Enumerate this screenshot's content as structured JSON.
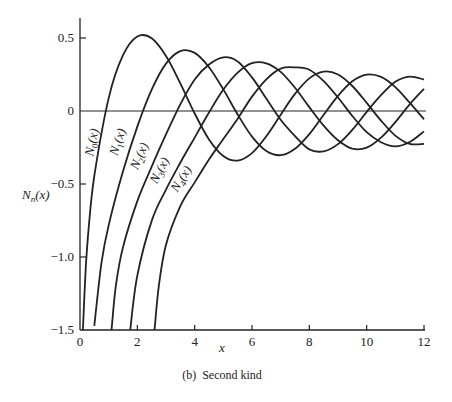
{
  "chart_data": {
    "type": "line",
    "title": "",
    "caption": "(b)  Second kind",
    "xlabel": "x",
    "ylabel": "N_n(x)",
    "xlim": [
      0,
      12
    ],
    "ylim": [
      -1.5,
      0.6
    ],
    "xticks": [
      0,
      2,
      4,
      6,
      8,
      10,
      12
    ],
    "xtick_labels": [
      "0",
      "2",
      "4",
      "6",
      "8",
      "10",
      "12"
    ],
    "yticks": [
      0.5,
      0,
      -0.5,
      -1.0,
      -1.5
    ],
    "ytick_labels": [
      "0.5",
      "0",
      "−0.5",
      "−1.0",
      "−1.5"
    ],
    "grid": false,
    "legend": "inline curve labels",
    "zero_line": true,
    "line_color": "#222222",
    "series": [
      {
        "name": "N0(x)",
        "label_main": "N",
        "label_sub": "0",
        "label_tail": "(x)",
        "x": [
          0.1,
          0.2,
          0.3,
          0.5,
          1.0,
          1.5,
          2.0,
          2.5,
          3.0,
          3.5,
          4.0,
          4.5,
          5.0,
          5.5,
          6.0,
          6.5,
          7.0,
          7.5,
          8.0,
          8.5,
          9.0,
          9.5,
          10.0,
          10.5,
          11.0,
          11.5,
          12.0
        ],
        "y": [
          -1.5342,
          -1.0811,
          -0.8073,
          -0.4445,
          0.0883,
          0.3824,
          0.5104,
          0.4981,
          0.3769,
          0.189,
          -0.0169,
          -0.1947,
          -0.3085,
          -0.3395,
          -0.2882,
          -0.1732,
          -0.0259,
          0.1173,
          0.2235,
          0.2702,
          0.2499,
          0.1712,
          0.0557,
          -0.066,
          -0.1688,
          -0.2252,
          -0.2252
        ],
        "label_pos": [
          0.55,
          -0.22
        ],
        "label_angle": -78
      },
      {
        "name": "N1(x)",
        "label_main": "N",
        "label_sub": "1",
        "label_tail": "(x)",
        "x": [
          0.5,
          0.75,
          1.0,
          1.5,
          2.0,
          2.5,
          3.0,
          3.5,
          4.0,
          4.5,
          5.0,
          5.5,
          6.0,
          6.5,
          7.0,
          7.5,
          8.0,
          8.5,
          9.0,
          9.5,
          10.0,
          10.5,
          11.0,
          11.5,
          12.0
        ],
        "y": [
          -1.4715,
          -1.0385,
          -0.7812,
          -0.4123,
          -0.107,
          0.1459,
          0.3247,
          0.4102,
          0.3979,
          0.3001,
          0.1479,
          -0.0238,
          -0.175,
          -0.2741,
          -0.3027,
          -0.2591,
          -0.1581,
          -0.0262,
          0.1043,
          0.2032,
          0.249,
          0.2337,
          0.1637,
          0.0571,
          -0.0571
        ],
        "label_pos": [
          1.45,
          -0.22
        ],
        "label_angle": -72
      },
      {
        "name": "N2(x)",
        "label_main": "N",
        "label_sub": "2",
        "label_tail": "(x)",
        "x": [
          1.1,
          1.25,
          1.5,
          2.0,
          2.5,
          3.0,
          3.5,
          4.0,
          4.5,
          5.0,
          5.5,
          6.0,
          6.5,
          7.0,
          7.5,
          8.0,
          8.5,
          9.0,
          9.5,
          10.0,
          10.5,
          11.0,
          11.5,
          12.0
        ],
        "y": [
          -1.5,
          -1.2,
          -0.9322,
          -0.6174,
          -0.3813,
          -0.1604,
          0.0453,
          0.2159,
          0.3183,
          0.3677,
          0.3395,
          0.2299,
          0.0846,
          -0.0605,
          -0.1717,
          -0.263,
          -0.276,
          -0.2267,
          -0.129,
          -0.0059,
          0.1092,
          0.1999,
          0.2358,
          0.2157
        ],
        "label_pos": [
          2.2,
          -0.32
        ],
        "label_angle": -66
      },
      {
        "name": "N3(x)",
        "label_main": "N",
        "label_sub": "3",
        "label_tail": "(x)",
        "x": [
          1.75,
          2.0,
          2.5,
          3.0,
          3.5,
          4.0,
          4.5,
          5.0,
          5.5,
          6.0,
          6.5,
          7.0,
          7.5,
          8.0,
          8.5,
          9.0,
          9.5,
          10.0,
          10.5,
          11.0,
          11.5,
          12.0
        ],
        "y": [
          -1.5,
          -1.1278,
          -0.7524,
          -0.5385,
          -0.3538,
          -0.1821,
          -0.0101,
          0.1463,
          0.2631,
          0.3282,
          0.3267,
          0.2681,
          0.1586,
          0.0265,
          -0.101,
          -0.2008,
          -0.2579,
          -0.2513,
          -0.1829,
          -0.0766,
          0.0453,
          0.152
        ],
        "label_pos": [
          2.9,
          -0.42
        ],
        "label_angle": -62
      },
      {
        "name": "N4(x)",
        "label_main": "N",
        "label_sub": "4",
        "label_tail": "(x)",
        "x": [
          2.6,
          2.75,
          3.0,
          3.5,
          4.0,
          4.5,
          5.0,
          5.5,
          6.0,
          6.5,
          7.0,
          7.5,
          8.0,
          8.5,
          9.0,
          9.5,
          10.0,
          10.5,
          11.0,
          11.5,
          12.0
        ],
        "y": [
          -1.5,
          -1.2,
          -0.9166,
          -0.6518,
          -0.4891,
          -0.3318,
          -0.1921,
          -0.0525,
          0.0983,
          0.217,
          0.2903,
          0.2986,
          0.2829,
          0.2047,
          0.0928,
          -0.034,
          -0.1449,
          -0.2137,
          -0.2417,
          -0.2122,
          -0.1397
        ],
        "label_pos": [
          3.65,
          -0.48
        ],
        "label_angle": -58
      }
    ]
  }
}
